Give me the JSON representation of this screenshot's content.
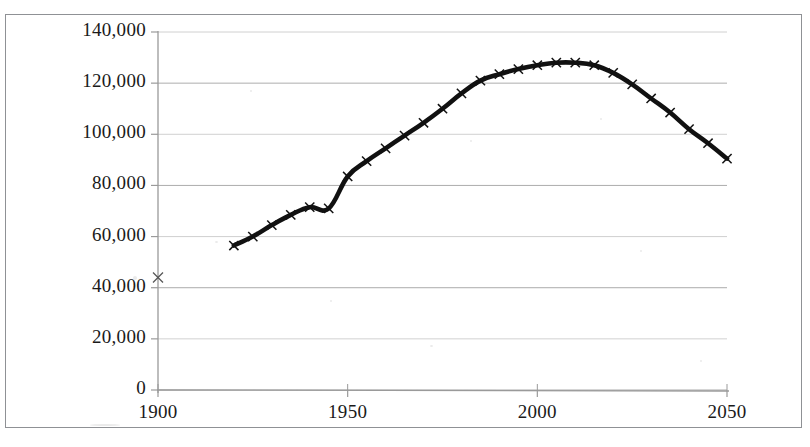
{
  "figure": {
    "background_color": "#ffffff",
    "frame_color": "#8f9195",
    "gridline_color": "#a8a8a8",
    "axis_color": "#9a9a9a",
    "series_color": "#111111"
  },
  "chart_data": {
    "type": "line",
    "title": "",
    "subtitle": "",
    "xlabel": "",
    "ylabel": "",
    "grid": "horizontal",
    "legend_position": "none",
    "xlim": [
      1900,
      2050
    ],
    "ylim": [
      0,
      140000
    ],
    "xticks": [
      1900,
      1950,
      2000,
      2050
    ],
    "xtick_labels": [
      "1900",
      "1950",
      "2000",
      "2050"
    ],
    "yticks": [
      0,
      20000,
      40000,
      60000,
      80000,
      100000,
      120000,
      140000
    ],
    "ytick_labels": [
      "0",
      "20,000",
      "40,000",
      "60,000",
      "80,000",
      "100,000",
      "120,000",
      "140,000"
    ],
    "marker": "x",
    "annotations": [
      {
        "text": "isolated data point at 1900 with no connecting line",
        "x": 1900,
        "y": 44000
      }
    ],
    "series": [
      {
        "name": "Population",
        "connected_from": 1920,
        "x": [
          1900,
          1920,
          1925,
          1930,
          1935,
          1940,
          1945,
          1950,
          1955,
          1960,
          1965,
          1970,
          1975,
          1980,
          1985,
          1990,
          1995,
          2000,
          2005,
          2010,
          2015,
          2020,
          2025,
          2030,
          2035,
          2040,
          2045,
          2050
        ],
        "values": [
          44000,
          56500,
          60000,
          64500,
          68500,
          71500,
          71000,
          83500,
          89500,
          94500,
          99500,
          104500,
          110000,
          116000,
          121000,
          123500,
          125500,
          127000,
          128000,
          128000,
          127000,
          124000,
          119500,
          114000,
          108500,
          102000,
          96500,
          90500
        ]
      }
    ]
  }
}
